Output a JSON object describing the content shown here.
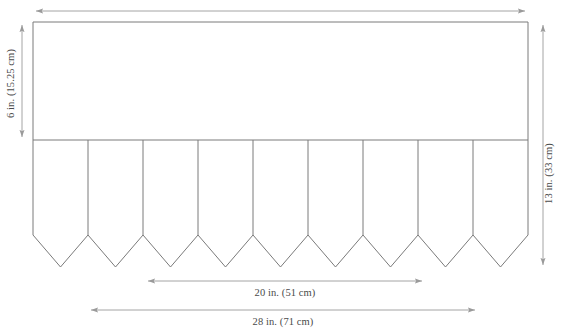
{
  "diagram": {
    "stroke_color": "#7a7a7a",
    "text_color": "#4a4a4a",
    "background_color": "#ffffff",
    "dimensions": {
      "band_height": {
        "label": "6 in. (15.25 cm)",
        "value_in": 6,
        "value_cm": 15.25,
        "orientation": "vertical",
        "side": "left"
      },
      "total_height": {
        "label": "13 in. (33 cm)",
        "value_in": 13,
        "value_cm": 33,
        "orientation": "vertical",
        "side": "right"
      },
      "inner_width": {
        "label": "20 in. (51 cm)",
        "value_in": 20,
        "value_cm": 51,
        "orientation": "horizontal",
        "side": "bottom"
      },
      "total_width": {
        "label": "28 in. (71 cm)",
        "value_in": 28,
        "value_cm": 71,
        "orientation": "horizontal",
        "side": "bottom"
      }
    },
    "shape": {
      "panel_left": 33,
      "panel_right": 528,
      "panel_top": 22,
      "band_divider_y": 140,
      "pennant_shoulder_y": 235,
      "pennant_tip_y": 267,
      "pennant_count": 9,
      "pennant_width": 55
    }
  }
}
